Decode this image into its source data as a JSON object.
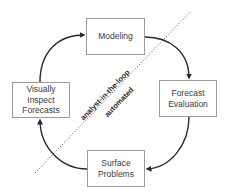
{
  "diagram": {
    "type": "cycle",
    "nodes": [
      {
        "id": "modeling",
        "label": "Modeling"
      },
      {
        "id": "evaluation",
        "label": "Forecast\nEvaluation"
      },
      {
        "id": "surface",
        "label": "Surface\nProblems"
      },
      {
        "id": "inspect",
        "label": "Visually\nInspect\nForecasts"
      }
    ],
    "edges": [
      {
        "from": "modeling",
        "to": "evaluation"
      },
      {
        "from": "evaluation",
        "to": "surface"
      },
      {
        "from": "surface",
        "to": "inspect"
      },
      {
        "from": "inspect",
        "to": "modeling"
      }
    ],
    "divider": {
      "style": "dotted",
      "label_above": "analyst-in-the-loop",
      "label_below": "automated"
    },
    "colors": {
      "box_border": "#9a9a9a",
      "arrow": "#2a2a2a",
      "divider": "#666666",
      "text": "#3a3a3a"
    }
  }
}
